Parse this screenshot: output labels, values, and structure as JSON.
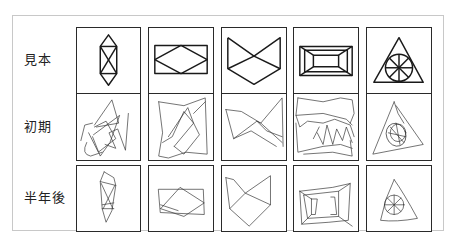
{
  "figure": {
    "rows": [
      {
        "label": "見本",
        "meaning": "model"
      },
      {
        "label": "初期",
        "meaning": "initial"
      },
      {
        "label": "半年後",
        "meaning": "after six months"
      }
    ],
    "columns": [
      {
        "shape": "elongated hexagon with X"
      },
      {
        "shape": "rectangle with inscribed diamond"
      },
      {
        "shape": "bowtie over diamond"
      },
      {
        "shape": "nested rectangles with connecting corners"
      },
      {
        "shape": "triangle with inscribed wheel circle"
      }
    ],
    "colors": {
      "stroke": "#1a1a1a",
      "panel_border": "#c8c8c8",
      "background": "#ffffff"
    }
  }
}
